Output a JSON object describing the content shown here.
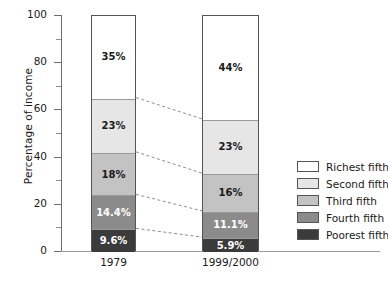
{
  "chart_data": {
    "type": "bar",
    "subtype": "stacked-bar-100",
    "title": "",
    "xlabel": "",
    "ylabel": "Percentage of income",
    "ylim": [
      0,
      100
    ],
    "yticks": [
      0,
      20,
      40,
      60,
      80,
      100
    ],
    "ytick_labels": [
      "0",
      "20",
      "40",
      "60",
      "80",
      "100"
    ],
    "yminor_ticks": [
      10,
      30,
      50,
      70,
      90
    ],
    "grid": false,
    "legend_position": "right",
    "categories": [
      "1979",
      "1999/2000"
    ],
    "series": [
      {
        "name": "Richest fifth",
        "color": "#ffffff",
        "values": [
          35,
          44
        ],
        "labels": [
          "35%",
          "44%"
        ]
      },
      {
        "name": "Second fifth",
        "color": "#e6e6e6",
        "values": [
          23,
          23
        ],
        "labels": [
          "23%",
          "23%"
        ]
      },
      {
        "name": "Third fifth",
        "color": "#c3c3c3",
        "values": [
          18,
          16
        ],
        "labels": [
          "18%",
          "16%"
        ]
      },
      {
        "name": "Fourth fifth",
        "color": "#8b8b8b",
        "values": [
          14.4,
          11.1
        ],
        "labels": [
          "14.4%",
          "11.1%"
        ]
      },
      {
        "name": "Poorest fifth",
        "color": "#3b3b3b",
        "values": [
          9.6,
          5.9
        ],
        "labels": [
          "9.6%",
          "5.9%"
        ]
      }
    ],
    "connector_style": "dashed",
    "connector_color": "#8e8e8e"
  },
  "axis": {
    "y_title": "Percentage of income",
    "y_tick_labels": [
      "100",
      "80",
      "60",
      "40",
      "20",
      "0"
    ]
  },
  "bars": {
    "bar1": {
      "category": "1979",
      "segments": [
        {
          "label": "35%",
          "series": "Richest fifth",
          "value": 35
        },
        {
          "label": "23%",
          "series": "Second fifth",
          "value": 23
        },
        {
          "label": "18%",
          "series": "Third fifth",
          "value": 18
        },
        {
          "label": "14.4%",
          "series": "Fourth fifth",
          "value": 14.4
        },
        {
          "label": "9.6%",
          "series": "Poorest fifth",
          "value": 9.6
        }
      ]
    },
    "bar2": {
      "category": "1999/2000",
      "segments": [
        {
          "label": "44%",
          "series": "Richest fifth",
          "value": 44
        },
        {
          "label": "23%",
          "series": "Second fifth",
          "value": 23
        },
        {
          "label": "16%",
          "series": "Third fifth",
          "value": 16
        },
        {
          "label": "11.1%",
          "series": "Fourth fifth",
          "value": 11.1
        },
        {
          "label": "5.9%",
          "series": "Poorest fifth",
          "value": 5.9
        }
      ]
    }
  },
  "legend": {
    "items": [
      {
        "label": "Richest fifth",
        "color": "#ffffff"
      },
      {
        "label": "Second fifth",
        "color": "#e6e6e6"
      },
      {
        "label": "Third fifth",
        "color": "#c3c3c3"
      },
      {
        "label": "Fourth fifth",
        "color": "#8b8b8b"
      },
      {
        "label": "Poorest fifth",
        "color": "#3b3b3b"
      }
    ]
  }
}
